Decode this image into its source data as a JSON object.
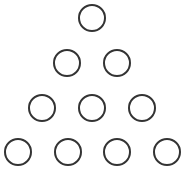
{
  "diagram": {
    "stroke_color": "#333333",
    "stroke_width": 2,
    "radius": 14,
    "rows": [
      {
        "count": 1,
        "centers": [
          [
            92,
            18
          ]
        ]
      },
      {
        "count": 2,
        "centers": [
          [
            67,
            63
          ],
          [
            117,
            63
          ]
        ]
      },
      {
        "count": 3,
        "centers": [
          [
            42,
            108
          ],
          [
            92,
            108
          ],
          [
            142,
            108
          ]
        ]
      },
      {
        "count": 4,
        "centers": [
          [
            18,
            152
          ],
          [
            68,
            152
          ],
          [
            117,
            152
          ],
          [
            167,
            152
          ]
        ]
      }
    ]
  }
}
